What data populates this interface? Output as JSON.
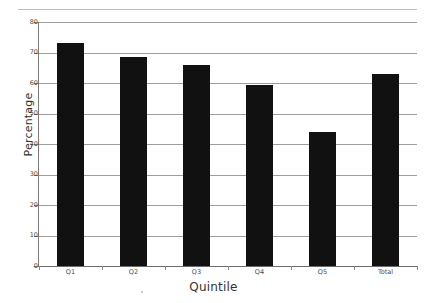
{
  "chart_data": {
    "type": "bar",
    "title": "",
    "categories": [
      "Q1",
      "Q2",
      "Q3",
      "Q4",
      "Q5",
      "Total"
    ],
    "values": [
      73,
      68.5,
      66,
      59.5,
      44,
      63
    ],
    "series": [
      {
        "name": "Percentage",
        "values": [
          73,
          68.5,
          66,
          59.5,
          44,
          63
        ]
      }
    ],
    "xlabel": "Quintile",
    "ylabel": "Percentage",
    "ylim": [
      0,
      80
    ],
    "ytick_values": [
      0,
      10,
      20,
      30,
      40,
      50,
      60,
      70,
      80
    ],
    "ytick_labels": [
      "0",
      "10",
      "20",
      "30",
      "40",
      "50",
      "60",
      "70",
      "80"
    ],
    "grid": true,
    "grid_axis": "y",
    "legend": false,
    "bar_color": "#111111",
    "grid_color": "#9d9d9d",
    "axis_color": "#7a7a7a",
    "background_color": "#ffffff"
  },
  "axes": {
    "x_title": "Quintile",
    "y_title": "Percentage"
  },
  "ticks": {
    "y": [
      "80",
      "70",
      "60",
      "50",
      "40",
      "30",
      "20",
      "10",
      "0"
    ],
    "x": [
      "Q1",
      "Q2",
      "Q3",
      "Q4",
      "Q5",
      "Total"
    ]
  }
}
